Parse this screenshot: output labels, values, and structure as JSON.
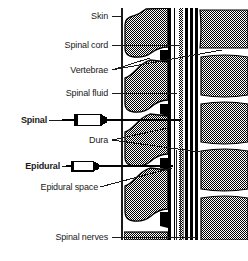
{
  "figure": {
    "style": "black-and-white line drawing with 50% dither shading",
    "colors": {
      "ink": "#000000",
      "paper": "#ffffff",
      "bone_fill_gray": "#808080",
      "leader_line": "#1a1a1a"
    }
  },
  "labels": {
    "skin": "Skin",
    "spinal_cord": "Spinal cord",
    "vertebrae": "Vertebrae",
    "spinal_fluid": "Spinal fluid",
    "spinal": "Spinal",
    "dura": "Dura",
    "epidural": "Epidural",
    "epidural_space": "Epidural space",
    "spinal_nerves": "Spinal nerves"
  },
  "label_positions": [
    {
      "key": "skin",
      "x": 108,
      "y": 16,
      "align": "right"
    },
    {
      "key": "spinal_cord",
      "x": 108,
      "y": 45,
      "align": "right"
    },
    {
      "key": "vertebrae",
      "x": 108,
      "y": 70,
      "align": "right"
    },
    {
      "key": "spinal_fluid",
      "x": 108,
      "y": 93,
      "align": "right"
    },
    {
      "key": "spinal",
      "x": 45,
      "y": 120,
      "align": "right"
    },
    {
      "key": "dura",
      "x": 108,
      "y": 140,
      "align": "right"
    },
    {
      "key": "epidural",
      "x": 58,
      "y": 166,
      "align": "right"
    },
    {
      "key": "epidural_space",
      "x": 96,
      "y": 187,
      "align": "right"
    },
    {
      "key": "spinal_nerves",
      "x": 108,
      "y": 237,
      "align": "right"
    }
  ],
  "anatomy": {
    "left_column_name": "spinous processes and vertebral arches",
    "right_column_name": "vertebral bodies",
    "canal_name": "spinal canal with cord, dura and spinal fluid",
    "vertebral_body_count": 5,
    "spinous_process_count": 4,
    "skin_line_x": 122
  },
  "instruments": [
    {
      "name": "spinal-needle-syringe",
      "label_key": "spinal",
      "tip_x": 180,
      "y": 120,
      "description": "spinal needle passing through dura into spinal fluid"
    },
    {
      "name": "epidural-needle-syringe",
      "label_key": "epidural",
      "tip_x": 172,
      "y": 166,
      "description": "epidural needle stopping in the epidural space"
    }
  ]
}
